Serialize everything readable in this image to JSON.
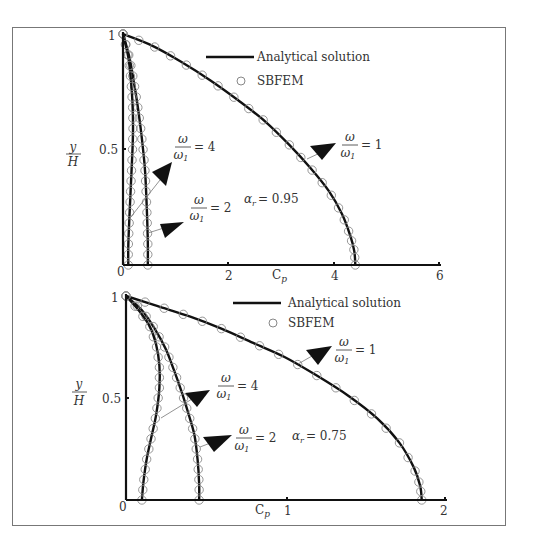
{
  "chart_data": [
    {
      "type": "line",
      "title": "",
      "annotation": "α_r = 0.95",
      "alpha_r": "0.95",
      "xlabel": "C_p",
      "ylabel": "y/H",
      "xlim": [
        0,
        6
      ],
      "ylim": [
        0,
        1
      ],
      "xticks": [
        "0",
        "2",
        "4",
        "6"
      ],
      "yticks": [
        "0.5",
        "1"
      ],
      "legend": [
        "Analytical solution",
        "SBFEM"
      ],
      "series": [
        {
          "name": "ω/ω1 = 1",
          "x": [
            0,
            0.55,
            1.1,
            1.65,
            2.2,
            2.7,
            3.15,
            3.55,
            3.9,
            4.15,
            4.3,
            4.38,
            4.4
          ],
          "y": [
            1,
            0.95,
            0.88,
            0.8,
            0.71,
            0.62,
            0.52,
            0.42,
            0.32,
            0.22,
            0.13,
            0.06,
            0
          ]
        },
        {
          "name": "ω/ω1 = 2",
          "x": [
            0,
            0.12,
            0.2,
            0.27,
            0.33,
            0.38,
            0.42,
            0.45,
            0.47,
            0.47
          ],
          "y": [
            1,
            0.9,
            0.8,
            0.7,
            0.6,
            0.5,
            0.4,
            0.25,
            0.1,
            0
          ]
        },
        {
          "name": "ω/ω1 = 4",
          "x": [
            0,
            0.1,
            0.15,
            0.18,
            0.19,
            0.18,
            0.15,
            0.12,
            0.1,
            0.1
          ],
          "y": [
            1,
            0.9,
            0.8,
            0.7,
            0.6,
            0.5,
            0.35,
            0.2,
            0.08,
            0
          ]
        }
      ],
      "labels": [
        {
          "text": "ω/ω1 = 1",
          "value": "1"
        },
        {
          "text": "ω/ω1 = 2",
          "value": "2"
        },
        {
          "text": "ω/ω1 = 4",
          "value": "4"
        }
      ]
    },
    {
      "type": "line",
      "title": "",
      "annotation": "α_r = 0.75",
      "alpha_r": "0.75",
      "xlabel": "C_p",
      "ylabel": "y/H",
      "xlim": [
        0,
        2
      ],
      "ylim": [
        0,
        1
      ],
      "xticks": [
        "0",
        "1",
        "2"
      ],
      "yticks": [
        "0.5",
        "1"
      ],
      "legend": [
        "Analytical solution",
        "SBFEM"
      ],
      "series": [
        {
          "name": "ω/ω1 = 1",
          "x": [
            0,
            0.2,
            0.4,
            0.6,
            0.8,
            1.0,
            1.2,
            1.4,
            1.58,
            1.72,
            1.81,
            1.85,
            1.86
          ],
          "y": [
            1,
            0.95,
            0.9,
            0.84,
            0.77,
            0.7,
            0.61,
            0.51,
            0.4,
            0.28,
            0.16,
            0.07,
            0
          ]
        },
        {
          "name": "ω/ω1 = 2",
          "x": [
            0,
            0.1,
            0.18,
            0.25,
            0.3,
            0.35,
            0.39,
            0.43,
            0.45,
            0.46,
            0.46
          ],
          "y": [
            1,
            0.93,
            0.84,
            0.74,
            0.64,
            0.53,
            0.43,
            0.32,
            0.2,
            0.08,
            0
          ]
        },
        {
          "name": "ω/ω1 = 4",
          "x": [
            0,
            0.08,
            0.15,
            0.19,
            0.21,
            0.21,
            0.19,
            0.16,
            0.13,
            0.11,
            0.1
          ],
          "y": [
            1,
            0.93,
            0.85,
            0.76,
            0.66,
            0.55,
            0.42,
            0.31,
            0.2,
            0.09,
            0
          ]
        }
      ],
      "labels": [
        {
          "text": "ω/ω1 = 1",
          "value": "1"
        },
        {
          "text": "ω/ω1 = 2",
          "value": "2"
        },
        {
          "text": "ω/ω1 = 4",
          "value": "4"
        }
      ]
    }
  ],
  "panels": [
    {
      "ylabel_num": "y",
      "ylabel_den": "H",
      "legend_line": "Analytical solution",
      "legend_marker": "SBFEM",
      "alpha_text": "= 0.95",
      "xlabel": "C",
      "xlabel_sub": "p",
      "omega": "ω",
      "omega1": "ω",
      "omega1_sub": "1",
      "eq1": "= 1",
      "eq2": "= 2",
      "eq4": "= 4",
      "xt0": "0",
      "xt1": "2",
      "xt2": "4",
      "xt3": "6",
      "yt_half": "0.5",
      "yt_one": "1"
    },
    {
      "ylabel_num": "y",
      "ylabel_den": "H",
      "legend_line": "Analytical solution",
      "legend_marker": "SBFEM",
      "alpha_text": "= 0.75",
      "xlabel": "C",
      "xlabel_sub": "p",
      "omega": "ω",
      "omega1": "ω",
      "omega1_sub": "1",
      "eq1": "= 1",
      "eq2": "= 2",
      "eq4": "= 4",
      "xt0": "0",
      "xt1": "1",
      "xt2": "2",
      "yt_half": "0.5",
      "yt_one": "1"
    }
  ]
}
